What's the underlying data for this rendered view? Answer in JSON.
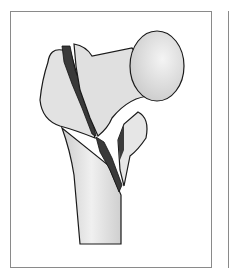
{
  "figure": {
    "colors": {
      "bone": "#e4e4e4",
      "bone_shade": "#c8c8c8",
      "fracture": "#3a3a3a",
      "outline": "#1a1a1a",
      "frame": "#8a8a8a"
    }
  }
}
